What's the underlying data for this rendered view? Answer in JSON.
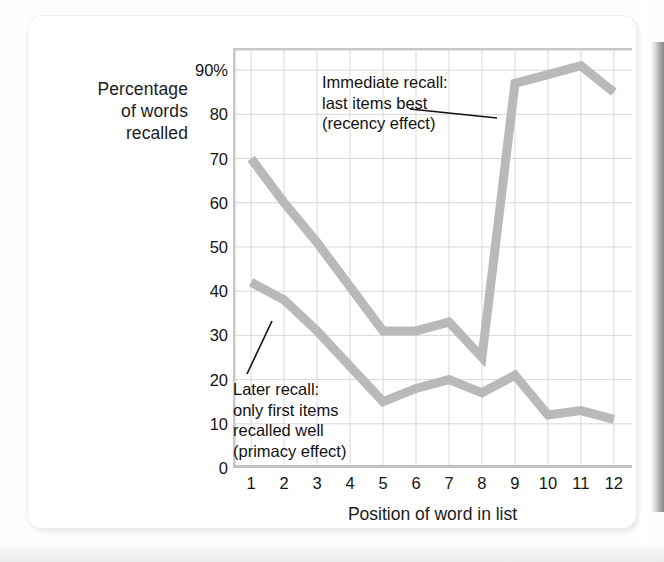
{
  "figure": {
    "y_axis_title_lines": [
      "Percentage",
      "of words",
      "recalled"
    ],
    "x_axis_title": "Position of word in list",
    "annotations": {
      "recency": [
        "Immediate recall:",
        "last items best",
        "(recency effect)"
      ],
      "primacy": [
        "Later recall:",
        "only first items",
        "recalled well",
        "(primacy effect)"
      ]
    }
  },
  "chart_data": {
    "type": "line",
    "title": "",
    "xlabel": "Position of word in list",
    "ylabel": "Percentage of words recalled",
    "x": [
      1,
      2,
      3,
      4,
      5,
      6,
      7,
      8,
      9,
      10,
      11,
      12
    ],
    "categories": [
      "1",
      "2",
      "3",
      "4",
      "5",
      "6",
      "7",
      "8",
      "9",
      "10",
      "11",
      "12"
    ],
    "xtick_labels": [
      "1",
      "2",
      "3",
      "4",
      "5",
      "6",
      "7",
      "8",
      "9",
      "10",
      "11",
      "12"
    ],
    "ytick_labels": [
      "90%",
      "80",
      "70",
      "60",
      "50",
      "40",
      "30",
      "20",
      "10",
      "0"
    ],
    "ytick_values": [
      90,
      80,
      70,
      60,
      50,
      40,
      30,
      20,
      10,
      0
    ],
    "ylim": [
      0,
      95
    ],
    "xlim": [
      0.45,
      12.55
    ],
    "grid": true,
    "legend": "none",
    "line_color": "#b9b9b9",
    "grid_color": "#d8d8d8",
    "series": [
      {
        "name": "Immediate recall",
        "annotation": "Immediate recall: last items best (recency effect)",
        "values": [
          70,
          60,
          51,
          41,
          31,
          31,
          33,
          25,
          87,
          89,
          91,
          85
        ]
      },
      {
        "name": "Later recall",
        "annotation": "Later recall: only first items recalled well (primacy effect)",
        "values": [
          42,
          38,
          31,
          23,
          15,
          18,
          20,
          17,
          21,
          12,
          13,
          11
        ]
      }
    ]
  }
}
